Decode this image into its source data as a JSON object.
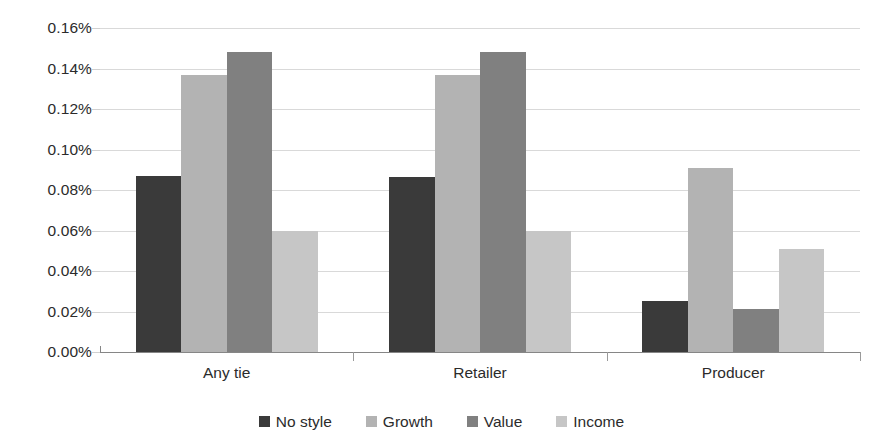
{
  "chart_data": {
    "type": "bar",
    "title": "",
    "subtitle": "",
    "xlabel": "",
    "ylabel": "",
    "categories": [
      "Any tie",
      "Retailer",
      "Producer"
    ],
    "series": [
      {
        "name": "No style",
        "color": "#3a3a3a",
        "values": [
          0.087,
          0.0865,
          0.025
        ]
      },
      {
        "name": "Growth",
        "color": "#b3b3b3",
        "values": [
          0.137,
          0.137,
          0.091
        ]
      },
      {
        "name": "Value",
        "color": "#808080",
        "values": [
          0.148,
          0.148,
          0.021
        ]
      },
      {
        "name": "Income",
        "color": "#c6c6c6",
        "values": [
          0.06,
          0.06,
          0.051
        ]
      }
    ],
    "ylim": [
      0,
      0.16
    ],
    "ytick_values": [
      0.0,
      0.02,
      0.04,
      0.06,
      0.08,
      0.1,
      0.12,
      0.14,
      0.16
    ],
    "ytick_labels": [
      "0.00%",
      "0.02%",
      "0.04%",
      "0.06%",
      "0.08%",
      "0.10%",
      "0.12%",
      "0.14%",
      "0.16%"
    ],
    "value_unit": "%",
    "grid": true,
    "grid_axis": "y",
    "legend_position": "bottom",
    "bar_gap_within_group": 0,
    "background_color": "#ffffff",
    "gridline_color": "#d9d9d9",
    "axis_color": "#868686",
    "text_color": "#2b2b2b"
  }
}
